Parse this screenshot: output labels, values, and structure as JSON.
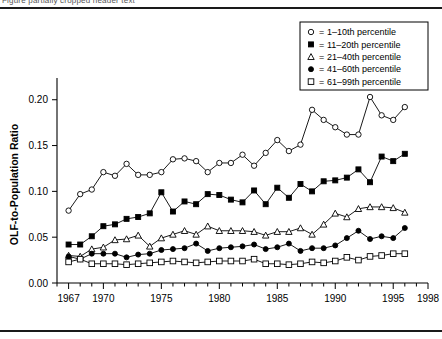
{
  "figure": {
    "clipped_caption": "Figure partially cropped header text",
    "axis_title_x": "Year",
    "axis_title_y": "OLF-to-Population Ratio"
  },
  "legend": {
    "equals": "=",
    "entries": [
      {
        "label": "1–10th percentile",
        "marker": "open-circle"
      },
      {
        "label": "11–20th percentile",
        "marker": "filled-square"
      },
      {
        "label": "21–40th percentile",
        "marker": "open-triangle"
      },
      {
        "label": "41–60th percentile",
        "marker": "filled-circle"
      },
      {
        "label": "61–99th percentile",
        "marker": "open-square"
      }
    ]
  },
  "chart_data": {
    "type": "line",
    "title": "",
    "subtitle": "",
    "xlabel": "Year",
    "ylabel": "OLF-to-Population Ratio",
    "xlim": [
      1966,
      1998
    ],
    "ylim": [
      0.0,
      0.215
    ],
    "grid": false,
    "legend_position": "top-right",
    "x_ticks_major": [
      1967,
      1970,
      1975,
      1980,
      1985,
      1990,
      1995,
      1998
    ],
    "x_ticks_minor_step": 1,
    "y_ticks": [
      0.0,
      0.05,
      0.1,
      0.15,
      0.2
    ],
    "y_tick_labels": [
      "0.00",
      "0.05",
      "0.10",
      "0.15",
      "0.20"
    ],
    "x": [
      1967,
      1968,
      1969,
      1970,
      1971,
      1972,
      1973,
      1974,
      1975,
      1976,
      1977,
      1978,
      1979,
      1980,
      1981,
      1982,
      1983,
      1984,
      1985,
      1986,
      1987,
      1988,
      1989,
      1990,
      1991,
      1992,
      1993,
      1994,
      1995,
      1996
    ],
    "series": [
      {
        "name": "1–10th percentile",
        "marker": "open-circle",
        "values": [
          0.079,
          0.097,
          0.102,
          0.121,
          0.117,
          0.13,
          0.118,
          0.118,
          0.121,
          0.135,
          0.136,
          0.133,
          0.121,
          0.131,
          0.131,
          0.14,
          0.128,
          0.142,
          0.156,
          0.144,
          0.151,
          0.189,
          0.178,
          0.17,
          0.162,
          0.162,
          0.203,
          0.183,
          0.178,
          0.192
        ]
      },
      {
        "name": "11–20th percentile",
        "marker": "filled-square",
        "values": [
          0.042,
          0.042,
          0.051,
          0.062,
          0.064,
          0.07,
          0.072,
          0.076,
          0.099,
          0.078,
          0.089,
          0.086,
          0.097,
          0.096,
          0.091,
          0.088,
          0.101,
          0.086,
          0.104,
          0.093,
          0.108,
          0.1,
          0.111,
          0.112,
          0.115,
          0.124,
          0.11,
          0.138,
          0.133,
          0.141
        ]
      },
      {
        "name": "21–40th percentile",
        "marker": "open-triangle",
        "values": [
          0.03,
          0.029,
          0.037,
          0.039,
          0.047,
          0.048,
          0.052,
          0.04,
          0.049,
          0.053,
          0.057,
          0.053,
          0.062,
          0.057,
          0.057,
          0.057,
          0.056,
          0.052,
          0.056,
          0.056,
          0.06,
          0.053,
          0.064,
          0.076,
          0.072,
          0.081,
          0.083,
          0.083,
          0.082,
          0.077
        ]
      },
      {
        "name": "41–60th percentile",
        "marker": "filled-circle",
        "values": [
          0.029,
          0.026,
          0.032,
          0.032,
          0.032,
          0.028,
          0.031,
          0.032,
          0.036,
          0.037,
          0.038,
          0.043,
          0.035,
          0.038,
          0.039,
          0.04,
          0.042,
          0.037,
          0.039,
          0.043,
          0.035,
          0.038,
          0.038,
          0.041,
          0.049,
          0.057,
          0.048,
          0.051,
          0.049,
          0.06
        ]
      },
      {
        "name": "61–99th percentile",
        "marker": "open-square",
        "values": [
          0.023,
          0.026,
          0.021,
          0.021,
          0.021,
          0.02,
          0.021,
          0.022,
          0.023,
          0.024,
          0.023,
          0.022,
          0.023,
          0.024,
          0.024,
          0.024,
          0.026,
          0.021,
          0.021,
          0.02,
          0.021,
          0.023,
          0.022,
          0.024,
          0.028,
          0.025,
          0.029,
          0.03,
          0.032,
          0.032
        ]
      }
    ]
  }
}
